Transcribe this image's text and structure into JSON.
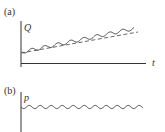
{
  "panels": [
    {
      "id": "a",
      "label": "(a)",
      "y_axis_label": "Q",
      "x_axis_label": "t",
      "curves": [
        {
          "name": "oscillating",
          "style": "solid",
          "trend": "increasing"
        },
        {
          "name": "mean-trend",
          "style": "dashed",
          "trend": "increasing"
        }
      ]
    },
    {
      "id": "b",
      "label": "(b)",
      "y_axis_label": "p",
      "curves": [
        {
          "name": "oscillating",
          "style": "solid",
          "trend": "constant"
        }
      ]
    }
  ],
  "colors": {
    "axis": "#333333",
    "curve": "#444444",
    "dashed": "#555555"
  }
}
